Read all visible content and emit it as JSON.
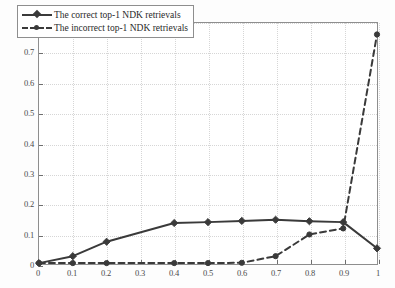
{
  "chart_data": {
    "type": "line",
    "title": "",
    "xlabel": "",
    "ylabel": "",
    "xlim": [
      0,
      1
    ],
    "ylim": [
      0,
      0.8
    ],
    "grid": true,
    "legend_position": "upper left",
    "x": [
      0,
      0.1,
      0.2,
      0.4,
      0.5,
      0.6,
      0.7,
      0.8,
      0.9,
      1
    ],
    "xticks": [
      "0",
      "0.1",
      "0.2",
      "0.3",
      "0.4",
      "0.5",
      "0.6",
      "0.7",
      "0.8",
      "0.9",
      "1"
    ],
    "xtick_values": [
      0,
      0.1,
      0.2,
      0.3,
      0.4,
      0.5,
      0.6,
      0.7,
      0.8,
      0.9,
      1
    ],
    "yticks": [
      "0",
      "0.1",
      "0.2",
      "0.3",
      "0.4",
      "0.5",
      "0.6",
      "0.7",
      "0.8"
    ],
    "ytick_values": [
      0,
      0.1,
      0.2,
      0.3,
      0.4,
      0.5,
      0.6,
      0.7,
      0.8
    ],
    "series": [
      {
        "name": "The correct top-1 NDK retrievals",
        "style": "solid",
        "marker": "diamond",
        "color": "#3a3a3a",
        "x": [
          0,
          0.1,
          0.2,
          0.4,
          0.5,
          0.6,
          0.7,
          0.8,
          0.9,
          1
        ],
        "values": [
          0.003,
          0.026,
          0.074,
          0.136,
          0.139,
          0.143,
          0.147,
          0.142,
          0.139,
          0.052
        ]
      },
      {
        "name": "The incorrect top-1 NDK retrievals",
        "style": "dashed",
        "marker": "circle",
        "color": "#3a3a3a",
        "x": [
          0,
          0.1,
          0.2,
          0.4,
          0.5,
          0.6,
          0.7,
          0.8,
          0.9,
          1
        ],
        "values": [
          0.003,
          0.003,
          0.003,
          0.003,
          0.003,
          0.004,
          0.026,
          0.098,
          0.118,
          0.762
        ]
      }
    ]
  },
  "legend": {
    "items": [
      {
        "label": "The correct top-1 NDK retrievals"
      },
      {
        "label": "The incorrect top-1 NDK retrievals"
      }
    ]
  },
  "colors": {
    "line": "#3a3a3a",
    "axis": "#8e8e8e",
    "grid": "#d6d6d6",
    "tick_text": "#4a4a4a",
    "background": "#ffffff"
  }
}
